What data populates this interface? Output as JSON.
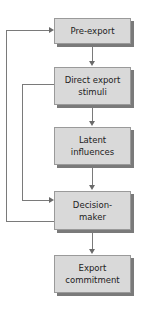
{
  "diagram": {
    "type": "flowchart",
    "nodes": [
      {
        "id": "pre_export",
        "label": "Pre-export"
      },
      {
        "id": "direct_stimuli",
        "label": "Direct export stimuli"
      },
      {
        "id": "latent",
        "label": "Latent influences"
      },
      {
        "id": "decision_maker",
        "label": "Decision-maker"
      },
      {
        "id": "commitment",
        "label": "Export commitment"
      }
    ],
    "edges": [
      {
        "from": "pre_export",
        "to": "direct_stimuli"
      },
      {
        "from": "direct_stimuli",
        "to": "latent"
      },
      {
        "from": "latent",
        "to": "decision_maker"
      },
      {
        "from": "decision_maker",
        "to": "commitment"
      },
      {
        "from": "direct_stimuli",
        "to": "decision_maker",
        "route": "left-inner"
      },
      {
        "from": "decision_maker",
        "to": "pre_export",
        "route": "left-outer"
      }
    ]
  },
  "labels": {
    "n1": "Pre-export",
    "n2a": "Direct export",
    "n2b": "stimuli",
    "n3a": "Latent",
    "n3b": "influences",
    "n4a": "Decision-",
    "n4b": "maker",
    "n5a": "Export",
    "n5b": "commitment"
  }
}
